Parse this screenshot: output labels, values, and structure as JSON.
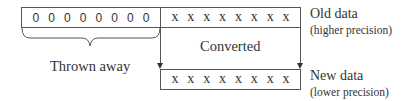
{
  "diagram": {
    "old_data": {
      "discarded_bits": [
        "0",
        "0",
        "0",
        "0",
        "0",
        "0",
        "0",
        "0"
      ],
      "kept_bits": [
        "x",
        "x",
        "x",
        "x",
        "x",
        "x",
        "x",
        "x"
      ],
      "label": "Old data",
      "sublabel": "(higher precision)"
    },
    "converted_label": "Converted",
    "thrown_away_label": "Thrown away",
    "new_data": {
      "bits": [
        "x",
        "x",
        "x",
        "x",
        "x",
        "x",
        "x",
        "x"
      ],
      "label": "New data",
      "sublabel": "(lower precision)"
    },
    "colors": {
      "line": "#555555",
      "text": "#333333",
      "background": "#ffffff"
    }
  }
}
